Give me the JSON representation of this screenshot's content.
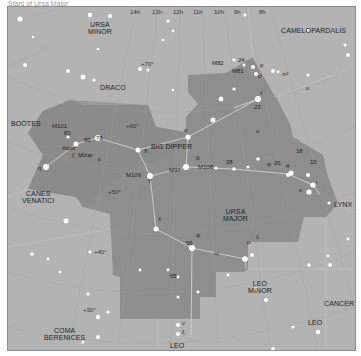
{
  "caption": "Stars of Ursa Major",
  "colors": {
    "background": "#b3b3b3",
    "constellation_fill": "#8e8e8e",
    "grid": "#9a9a9a",
    "boundary": "#c4c4c4",
    "stick_lines": "#d0d0d0",
    "stars": "#ffffff",
    "text": "#222222"
  },
  "ra_ticks": [
    "14h",
    "13h",
    "12h",
    "11h",
    "10h",
    "9h",
    "8h"
  ],
  "dec_ticks": [
    "+70°",
    "+60°",
    "+50°",
    "+40°",
    "+30°"
  ],
  "constellations": {
    "ursa_minor": "URSA\nMINOR",
    "camelopardalis": "CAMELOPARDALIS",
    "draco": "DRACO",
    "bootes": "BOÖTES",
    "big_dipper": "BIG DIPPER",
    "canes_venatici": "CANES\nVENATICI",
    "ursa_major": "URSA\nMAJOR",
    "lynx": "LYNX",
    "leo_minor": "LEO\nMINOR",
    "cancer": "CANCER",
    "coma_berenices": "COMA\nBERENICES",
    "leo": "LEO",
    "leo_south": "LEO"
  },
  "star_labels": {
    "m82": "M82",
    "m81": "M81",
    "s24": "24",
    "rho": "ρ",
    "sigma": "σ",
    "pi2": "π²",
    "tau": "τ",
    "s23": "23",
    "omicron": "ο",
    "m101": "M101",
    "s83": "83",
    "alcor": "Alcor",
    "s80": "80",
    "s78": "78",
    "zeta": "ζ",
    "mizar": "Mizar",
    "epsilon": "ε",
    "delta": "δ",
    "eta": "η",
    "alpha": "α",
    "beta": "β",
    "m108": "M108",
    "m97": "M97",
    "m109": "M109",
    "gamma": "γ",
    "upsilon": "υ",
    "s18": "18",
    "s15": "15",
    "s38": "38",
    "s26": "26",
    "theta": "θ",
    "phi": "φ",
    "iota": "ι",
    "kappa": "κ",
    "chi": "χ",
    "psi": "ψ",
    "s56": "56",
    "omega": "ω",
    "mu": "μ",
    "lambda": "λ",
    "s55": "55",
    "nu": "ν",
    "xi": "ξ"
  }
}
